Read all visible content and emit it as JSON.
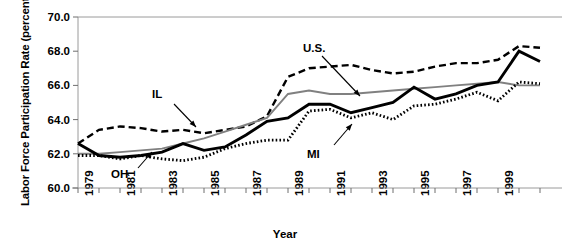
{
  "chart_data": {
    "type": "line",
    "title": "",
    "xlabel": "Year",
    "ylabel": "Labor Force Participation Rate (percent)",
    "ylim": [
      60.0,
      70.0
    ],
    "ytick_labels": [
      "60.0",
      "62.0",
      "64.0",
      "66.0",
      "68.0",
      "70.0"
    ],
    "ytick_values": [
      60.0,
      62.0,
      64.0,
      66.0,
      68.0,
      70.0
    ],
    "xlim": [
      1979,
      2001
    ],
    "xtick_labels": [
      "1979",
      "1981",
      "1983",
      "1985",
      "1987",
      "1989",
      "1991",
      "1993",
      "1995",
      "1997",
      "1999"
    ],
    "xtick_values": [
      1979,
      1981,
      1983,
      1985,
      1987,
      1989,
      1991,
      1993,
      1995,
      1997,
      1999
    ],
    "x": [
      1979,
      1980,
      1981,
      1982,
      1983,
      1984,
      1985,
      1986,
      1987,
      1988,
      1989,
      1990,
      1991,
      1992,
      1993,
      1994,
      1995,
      1996,
      1997,
      1998,
      1999,
      2000,
      2001
    ],
    "grid": false,
    "legend_position": "inline-annotations",
    "series": [
      {
        "name": "IL",
        "style": "dashed",
        "color": "#000000",
        "values": [
          62.6,
          63.4,
          63.6,
          63.5,
          63.3,
          63.4,
          63.2,
          63.4,
          63.6,
          64.2,
          66.5,
          67.0,
          67.1,
          67.2,
          66.9,
          66.7,
          66.8,
          67.1,
          67.3,
          67.3,
          67.5,
          68.3,
          68.2
        ]
      },
      {
        "name": "U.S.",
        "style": "solid-gray",
        "color": "#808080",
        "values": [
          62.0,
          62.0,
          62.1,
          62.2,
          62.3,
          62.6,
          62.9,
          63.3,
          63.7,
          64.1,
          65.5,
          65.7,
          65.5,
          65.5,
          65.6,
          65.7,
          65.8,
          65.9,
          66.0,
          66.1,
          66.2,
          66.0,
          66.0
        ]
      },
      {
        "name": "MI",
        "style": "solid-black",
        "color": "#000000",
        "values": [
          62.6,
          61.9,
          61.8,
          61.9,
          62.1,
          62.6,
          62.2,
          62.4,
          63.1,
          63.9,
          64.1,
          64.9,
          64.9,
          64.4,
          64.7,
          65.0,
          65.9,
          65.2,
          65.5,
          66.0,
          66.2,
          68.0,
          67.4
        ]
      },
      {
        "name": "OH",
        "style": "dotted",
        "color": "#000000",
        "values": [
          61.9,
          61.9,
          61.7,
          61.9,
          61.7,
          61.6,
          61.8,
          62.3,
          62.6,
          62.8,
          62.8,
          64.5,
          64.6,
          64.1,
          64.4,
          64.0,
          64.8,
          64.9,
          65.2,
          65.6,
          65.1,
          66.2,
          66.1
        ]
      }
    ]
  },
  "annotations": [
    {
      "name": "IL",
      "text": "IL"
    },
    {
      "name": "OH",
      "text": "OH"
    },
    {
      "name": "US",
      "text": "U.S."
    },
    {
      "name": "MI",
      "text": "MI"
    }
  ],
  "axis": {
    "y_title": "Labor Force Participation Rate (percent)",
    "x_title": "Year"
  }
}
